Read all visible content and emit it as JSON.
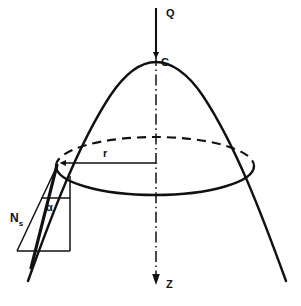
{
  "figure": {
    "background_color": "#ffffff",
    "line_color": "#111111"
  },
  "labels": {
    "apex_load": "Q",
    "apex_point": "C",
    "radius": "r",
    "axis": "Z",
    "meridional_force": "N",
    "meridional_force_subscript": "s",
    "angle": "α"
  },
  "elements": {
    "shell_meridian_name": "parabolic-dome-meridian",
    "ring_name": "horizontal-circular-ring",
    "axis_name": "vertical-symmetry-axis",
    "radius_line_name": "radius-dimension-line",
    "force_triangle_name": "force-component-triangle"
  },
  "geometry": {
    "apex": [
      156,
      62
    ],
    "axis_x": 156,
    "axis_top_y": 55,
    "axis_bottom_y": 282,
    "load_arrow_top_y": 8,
    "load_arrow_bottom_y": 58,
    "ring_center": [
      155,
      168
    ],
    "ring_semi_major": 99,
    "ring_semi_minor": 28,
    "ring_left_point": [
      56,
      164
    ],
    "ring_right_point": [
      254,
      164
    ],
    "radius_line_y": 163,
    "radius_line_from_x": 56,
    "radius_line_to_x": 156,
    "triangle_apex": [
      56,
      165
    ],
    "triangle_bottom_right": [
      70,
      251
    ],
    "triangle_bottom_left": [
      17,
      251
    ],
    "angle_tick_y": 198,
    "angle_tick_from_x": 41,
    "angle_tick_to_x": 70,
    "meridian_left_end": [
      28,
      281
    ],
    "meridian_right_end": [
      286,
      281
    ]
  }
}
